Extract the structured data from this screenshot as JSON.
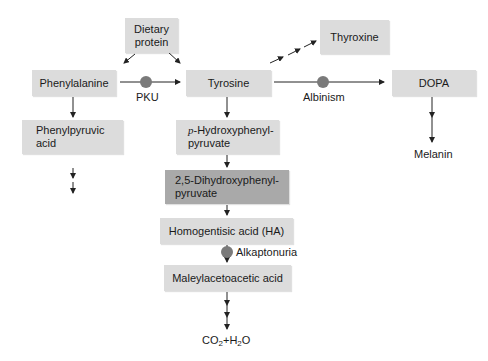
{
  "diagram": {
    "nodes": {
      "dietary_protein": {
        "line1": "Dietary",
        "line2": "protein"
      },
      "phenylalanine": "Phenylalanine",
      "tyrosine": "Tyrosine",
      "thyroxine": "Thyroxine",
      "dopa": "DOPA",
      "melanin": "Melanin",
      "phenylpyruvic_acid": {
        "line1": "Phenylpyruvic",
        "line2": "acid"
      },
      "p_hydroxyphenylpyruvate": {
        "prefix": "p",
        "line1": "-Hydroxyphenyl-",
        "line2": "pyruvate"
      },
      "dihydroxyphenylpyruvate": {
        "line1": "2,5-Dihydroxyphenyl-",
        "line2": "pyruvate"
      },
      "homogentisic_acid": "Homogentisic acid (HA)",
      "maleylacetoacetic_acid": "Maleylacetoacetic acid",
      "end_product": {
        "co": "CO",
        "sub1": "2",
        "plus_h": "+H",
        "sub2": "2",
        "o": "O"
      }
    },
    "blocks": {
      "pku": "PKU",
      "albinism": "Albinism",
      "alkaptonuria": "Alkaptonuria"
    },
    "colors": {
      "box": "#dcdcdc",
      "box_dark": "#a9a9a9",
      "block_dot": "#7a7a7a",
      "arrow": "#222222"
    }
  }
}
